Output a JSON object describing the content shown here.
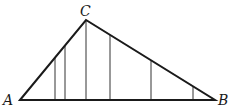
{
  "diagram": {
    "labels": {
      "A": "A",
      "B": "B",
      "C": "C"
    },
    "points": {
      "A": [
        20,
        100
      ],
      "B": [
        215,
        100
      ],
      "C": [
        86,
        20
      ]
    },
    "verticals_x": [
      55,
      65,
      86,
      110,
      151,
      193
    ],
    "colors": {
      "stroke": "#1a1a1a",
      "thin": "#333333"
    }
  }
}
